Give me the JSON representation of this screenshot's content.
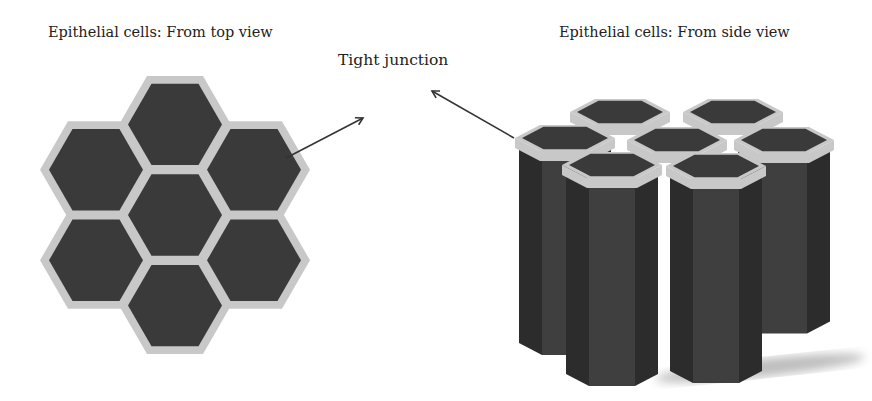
{
  "figure": {
    "labels": {
      "top_view": "Epithelial cells: From top view",
      "side_view": "Epithelial cells: From side view",
      "tight_junction": "Tight junction"
    },
    "colors": {
      "cell_fill": "#3a3a3a",
      "junction": "#c8c8c8",
      "side_dark": "#2c2c2c",
      "side_mid": "#3f3f3f",
      "arrow": "#333333",
      "shadow": "#bdbdbd"
    },
    "top_view_cells": 7,
    "side_view_columns": 7
  }
}
